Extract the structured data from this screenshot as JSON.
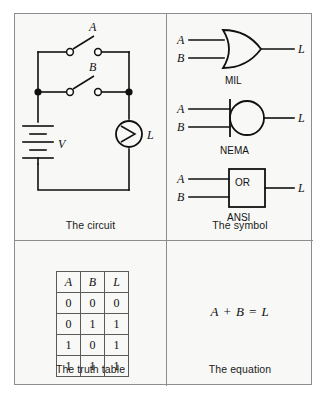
{
  "figure": {
    "panels": {
      "circuit": {
        "caption": "The circuit",
        "labels": {
          "switch_a": "A",
          "switch_b": "B",
          "source": "V",
          "lamp": "L"
        },
        "components": [
          {
            "name": "battery",
            "label": "V",
            "type": "dc-voltage-source"
          },
          {
            "name": "switch-a",
            "label": "A",
            "type": "spst-switch",
            "state": "open"
          },
          {
            "name": "switch-b",
            "label": "B",
            "type": "spst-switch",
            "state": "open"
          },
          {
            "name": "lamp",
            "label": "L",
            "type": "lamp"
          }
        ],
        "topology": "two switches in parallel, in series with lamp and source"
      },
      "symbol": {
        "caption": "The symbol",
        "gates": [
          {
            "standard": "MIL",
            "shape": "or-curved-shield",
            "inputs": [
              "A",
              "B"
            ],
            "output": "L",
            "body_label": ""
          },
          {
            "standard": "NEMA",
            "shape": "circle-with-bar",
            "inputs": [
              "A",
              "B"
            ],
            "output": "L",
            "body_label": ""
          },
          {
            "standard": "ANSI",
            "shape": "rectangle",
            "inputs": [
              "A",
              "B"
            ],
            "output": "L",
            "body_label": "OR"
          }
        ]
      },
      "truth": {
        "caption": "The truth table",
        "headers": [
          "A",
          "B",
          "L"
        ],
        "rows": [
          [
            "0",
            "0",
            "0"
          ],
          [
            "0",
            "1",
            "1"
          ],
          [
            "1",
            "0",
            "1"
          ],
          [
            "1",
            "1",
            "1"
          ]
        ]
      },
      "equation": {
        "caption": "The equation",
        "expression": "A + B = L"
      }
    },
    "colors": {
      "ink": "#111111",
      "border": "#8d8d8d",
      "background": "#f8f8f6"
    }
  }
}
